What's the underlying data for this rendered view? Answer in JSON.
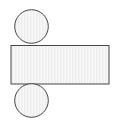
{
  "canvas": {
    "width": 116,
    "height": 121,
    "background_color": "#ffffff",
    "title": "Roller and beam geometric figure"
  },
  "style": {
    "stroke_color": "#474747",
    "stroke_width": 1,
    "fill_color": "#fbfbfb",
    "hatch_color": "#e2e2e2",
    "hatch_spacing": 1.5,
    "hatch_orientation": "vertical"
  },
  "shapes": [
    {
      "id": "top-circle",
      "name": "top-circle",
      "type": "circle",
      "cx": 31.5,
      "cy": 26.5,
      "r": 16.8,
      "fill": "#fbfbfb",
      "stroke": "#474747",
      "stroke_width": 1,
      "hatched": true,
      "label": "Top circle"
    },
    {
      "id": "center-rectangle",
      "name": "center-rectangle",
      "type": "rect",
      "x": 11,
      "y": 45.5,
      "width": 98,
      "height": 38.5,
      "fill": "#fbfbfb",
      "stroke": "#474747",
      "stroke_width": 1,
      "hatched": true,
      "label": "Center rectangle"
    },
    {
      "id": "bottom-circle",
      "name": "bottom-circle",
      "type": "circle",
      "cx": 31.5,
      "cy": 100.5,
      "r": 16.8,
      "fill": "#fbfbfb",
      "stroke": "#474747",
      "stroke_width": 1,
      "hatched": true,
      "label": "Bottom circle"
    }
  ],
  "annotations": {
    "visible_text": [],
    "notes": "Two equal circles vertically aligned, tangent to the top and bottom edges of a horizontal rectangle."
  }
}
